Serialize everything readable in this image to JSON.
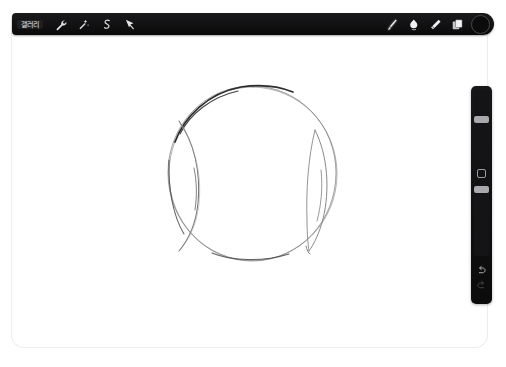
{
  "app": {
    "name": "Procreate",
    "canvas_background": "#ffffff",
    "toolbar_color": "#0d0d0e",
    "accent_color": "#a9a9ad"
  },
  "status_bar": {
    "time": "",
    "items": [
      "",
      "",
      "",
      ""
    ],
    "right_items": [
      "",
      ""
    ]
  },
  "top_toolbar": {
    "gallery_label": "갤러리",
    "left_tools": [
      {
        "name": "actions-tool",
        "icon": "wrench-icon",
        "label": "동작",
        "selected": false
      },
      {
        "name": "adjustments-tool",
        "icon": "magic-wand-icon",
        "label": "조정",
        "selected": false
      },
      {
        "name": "selection-tool",
        "icon": "s-curve-icon",
        "label": "선택",
        "selected": false
      },
      {
        "name": "transform-tool",
        "icon": "arrow-icon",
        "label": "변형",
        "selected": false
      }
    ],
    "right_tools": [
      {
        "name": "paint-tool",
        "icon": "brush-icon",
        "label": "브러시",
        "selected": true
      },
      {
        "name": "smudge-tool",
        "icon": "smudge-icon",
        "label": "문지르기",
        "selected": false
      },
      {
        "name": "erase-tool",
        "icon": "eraser-icon",
        "label": "지우개",
        "selected": false
      },
      {
        "name": "layers-tool",
        "icon": "layers-icon",
        "label": "레이어",
        "selected": false
      }
    ],
    "color_swatch": {
      "name": "color-swatch",
      "label": "색상",
      "hex": "#0b0b0c"
    }
  },
  "side_toolbar": {
    "brush_size": {
      "label": "브러시 크기",
      "value_percent": 62,
      "thumb_top_px": 26
    },
    "brush_opacity": {
      "label": "불투명도",
      "value_percent": 97,
      "thumb_top_px": 2
    },
    "modify_button": {
      "label": "수정"
    },
    "undo_button": {
      "label": "실행 취소"
    },
    "redo_button": {
      "label": "다시 실행"
    }
  },
  "artwork": {
    "title": "구체 스케치",
    "description": "연필로 그린 원과 좌우 안쪽 타원 호 (구 형태 스케치)",
    "stroke_color": "#3a3a3a",
    "shapes": [
      {
        "name": "outer-circle",
        "type": "ellipse",
        "cx": 240,
        "cy": 153,
        "rx": 83,
        "ry": 87
      },
      {
        "name": "left-inner-arc",
        "type": "arc",
        "side": "left"
      },
      {
        "name": "right-inner-arc",
        "type": "arc",
        "side": "right"
      }
    ]
  }
}
